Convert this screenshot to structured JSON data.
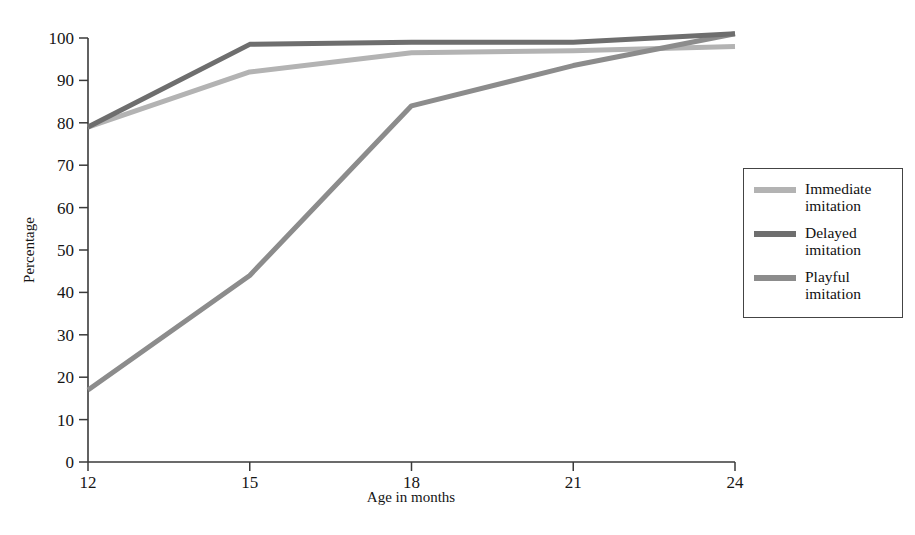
{
  "chart_data": {
    "type": "line",
    "title": "",
    "xlabel": "Age in months",
    "ylabel": "Percentage",
    "x": [
      12,
      15,
      18,
      21,
      24
    ],
    "xtick_labels": [
      "12",
      "15",
      "18",
      "21",
      "24"
    ],
    "ytick_labels": [
      "0",
      "10",
      "20",
      "30",
      "40",
      "50",
      "60",
      "70",
      "80",
      "90",
      "100"
    ],
    "yticks": [
      0,
      10,
      20,
      30,
      40,
      50,
      60,
      70,
      80,
      90,
      100
    ],
    "xlim": [
      12,
      24
    ],
    "ylim": [
      0,
      100
    ],
    "grid": false,
    "legend_position": "right",
    "series": [
      {
        "name": "Immediate imitation",
        "label_line1": "Immediate",
        "label_line2": "imitation",
        "color": "#b3b3b3",
        "values": [
          79,
          92,
          96.5,
          97,
          98
        ]
      },
      {
        "name": "Delayed imitation",
        "label_line1": "Delayed",
        "label_line2": "imitation",
        "color": "#6e6e6e",
        "values": [
          79,
          98.5,
          99,
          99,
          101
        ]
      },
      {
        "name": "Playful imitation",
        "label_line1": "Playful",
        "label_line2": "imitation",
        "color": "#8c8c8c",
        "values": [
          17,
          44,
          84,
          93.5,
          101
        ]
      }
    ]
  },
  "axis": {
    "x_title": "Age in months",
    "y_title": "Percentage",
    "axis_color": "#3a3a3a"
  },
  "legend": {
    "border_color": "#444444",
    "entries": [
      {
        "label": "Immediate\nimitation",
        "color": "#b3b3b3"
      },
      {
        "label": "Delayed\nimitation",
        "color": "#6e6e6e"
      },
      {
        "label": "Playful\nimitation",
        "color": "#8c8c8c"
      }
    ]
  }
}
